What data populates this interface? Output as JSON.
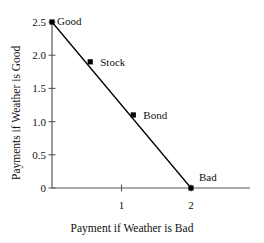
{
  "chart_data": {
    "type": "scatter",
    "title": "",
    "xlabel": "Payment if Weather is Bad",
    "ylabel": "Payments if Weather is Good",
    "xlim": [
      0,
      2.2
    ],
    "ylim": [
      0,
      2.5
    ],
    "grid": false,
    "legend": "none",
    "xticks": [
      1,
      2
    ],
    "xtick_labels": [
      "1",
      "2"
    ],
    "yticks": [
      0,
      0.5,
      1.0,
      1.5,
      2.0,
      2.5
    ],
    "ytick_labels": [
      "0",
      "0.5",
      "1.0",
      "1.5",
      "2.0",
      "2.5"
    ],
    "line_color": "#000000",
    "marker_color": "#000000",
    "axis_color": "#595959",
    "points": [
      {
        "label": "Good",
        "x": 0.0,
        "y": 2.5,
        "label_dx": 5,
        "label_dy": -1
      },
      {
        "label": "Stock",
        "x": 0.55,
        "y": 1.9,
        "label_dx": 10,
        "label_dy": 0
      },
      {
        "label": "Bond",
        "x": 1.17,
        "y": 1.1,
        "label_dx": 10,
        "label_dy": 0
      },
      {
        "label": "Bad",
        "x": 2.0,
        "y": 0.0,
        "label_dx": 8,
        "label_dy": -11
      }
    ],
    "series": [
      {
        "name": "budget-line",
        "x": [
          0.0,
          2.0
        ],
        "values": [
          2.5,
          0.0
        ]
      }
    ]
  }
}
